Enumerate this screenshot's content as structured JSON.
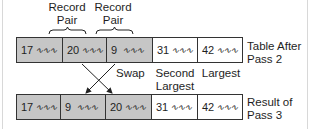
{
  "labels": {
    "pair1_line1": "Record",
    "pair1_line2": "Pair",
    "pair2_line1": "Record",
    "pair2_line2": "Pair",
    "swap": "Swap",
    "second_largest_line1": "Second",
    "second_largest_line2": "Largest",
    "largest": "Largest",
    "top_row_caption_line1": "Table After",
    "top_row_caption_line2": "Pass 2",
    "bottom_row_caption_line1": "Result of",
    "bottom_row_caption_line2": "Pass 3"
  },
  "squiggle": "∿∿∿",
  "top_row": [
    {
      "key": "17",
      "shaded": true
    },
    {
      "key": "20",
      "shaded": true
    },
    {
      "key": "9",
      "shaded": true
    },
    {
      "key": "31",
      "shaded": false
    },
    {
      "key": "42",
      "shaded": false
    }
  ],
  "bottom_row": [
    {
      "key": "17",
      "shaded": true
    },
    {
      "key": "9",
      "shaded": true
    },
    {
      "key": "20",
      "shaded": true
    },
    {
      "key": "31",
      "shaded": false
    },
    {
      "key": "42",
      "shaded": false
    }
  ],
  "colors": {
    "shaded": "#c6c6c6",
    "unshaded": "#ffffff",
    "line": "#333333"
  }
}
